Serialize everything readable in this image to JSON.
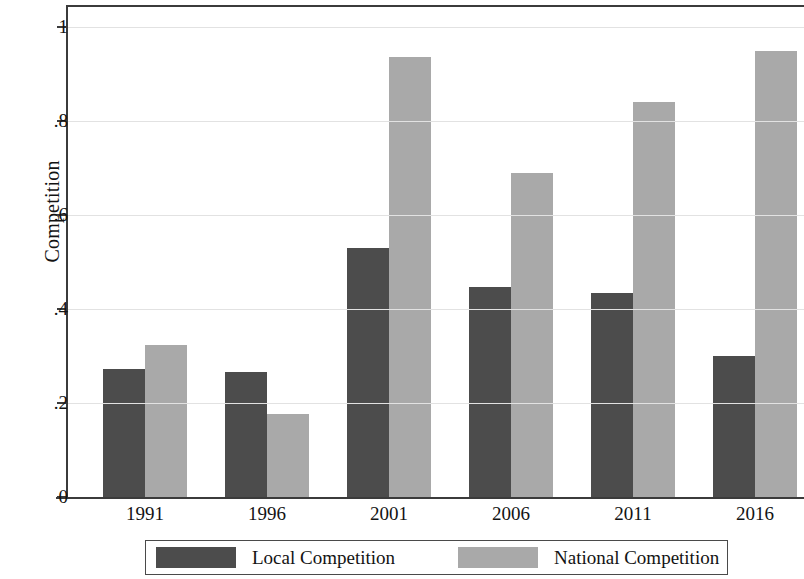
{
  "chart_data": {
    "type": "bar",
    "title": "",
    "xlabel": "",
    "ylabel": "Competition",
    "categories": [
      "1991",
      "1996",
      "2001",
      "2006",
      "2011",
      "2016"
    ],
    "series": [
      {
        "name": "Local Competition",
        "color": "#4c4c4c",
        "values": [
          0.273,
          0.265,
          0.529,
          0.446,
          0.434,
          0.3
        ]
      },
      {
        "name": "National Competition",
        "color": "#a9a9a9",
        "values": [
          0.323,
          0.176,
          0.936,
          0.69,
          0.84,
          0.95
        ]
      }
    ],
    "ylim": [
      0,
      1.05
    ],
    "y_ticks": [
      0,
      0.2,
      0.4,
      0.6,
      0.8,
      1
    ],
    "y_tick_labels": [
      "0",
      ".2",
      ".4",
      ".6",
      ".8",
      "1"
    ],
    "grid": true,
    "grid_axis": "y",
    "legend_position": "bottom",
    "legend_entries": [
      "Local Competition",
      "National Competition"
    ]
  },
  "axes": {
    "y_title": "Competition"
  }
}
